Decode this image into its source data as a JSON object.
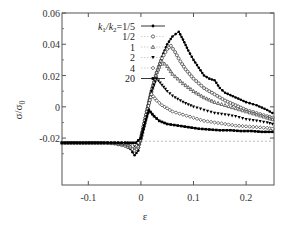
{
  "chart_data": {
    "type": "scatter",
    "title": "",
    "xlabel": "ε",
    "ylabel": "σ/σ0",
    "ylabel_main": "σ/σ",
    "ylabel_sub": "0",
    "xlim": [
      -0.15,
      0.253
    ],
    "ylim": [
      -0.05,
      0.06
    ],
    "xticks": [
      -0.1,
      0,
      0.1,
      0.2
    ],
    "xtick_labels": [
      "-0.1",
      "0",
      "0.1",
      "0.2"
    ],
    "yticks": [
      0.06,
      0.04,
      0.02,
      0,
      -0.02
    ],
    "ytick_labels": [
      "0.06",
      "0.04",
      "0.02",
      "0",
      "-0.02"
    ],
    "grid": false,
    "reference_line": {
      "y": -0.022,
      "style": "dashed",
      "x_from": 0
    },
    "legend": {
      "position": "upper-left",
      "title_prefix": "k1/k2=",
      "entries": [
        "1/5",
        "1/2",
        "1",
        "2",
        "4",
        "20"
      ]
    },
    "series": [
      {
        "name": "k1/k2=1/5",
        "label": "k1/k2=1/5",
        "marker": "filled-circle",
        "line": "solid",
        "x": [
          -0.15,
          -0.13,
          -0.11,
          -0.09,
          -0.07,
          -0.05,
          -0.04,
          -0.03,
          -0.02,
          -0.012,
          -0.005,
          0.0,
          0.01,
          0.02,
          0.03,
          0.04,
          0.05,
          0.06,
          0.072,
          0.08,
          0.09,
          0.1,
          0.11,
          0.12,
          0.13,
          0.14,
          0.15,
          0.16,
          0.18,
          0.2,
          0.22,
          0.24,
          0.25
        ],
        "y": [
          -0.023,
          -0.023,
          -0.023,
          -0.023,
          -0.023,
          -0.0235,
          -0.024,
          -0.025,
          -0.027,
          -0.031,
          -0.028,
          -0.02,
          -0.005,
          0.01,
          0.022,
          0.032,
          0.04,
          0.045,
          0.048,
          0.043,
          0.036,
          0.03,
          0.025,
          0.02,
          0.018,
          0.017,
          0.012,
          0.009,
          0.006,
          0.003,
          0.001,
          -0.002,
          -0.004
        ]
      },
      {
        "name": "1/2",
        "label": "1/2",
        "marker": "open-circle",
        "line": "dotted",
        "x": [
          -0.15,
          -0.11,
          -0.07,
          -0.05,
          -0.03,
          -0.02,
          -0.012,
          -0.005,
          0.0,
          0.01,
          0.02,
          0.03,
          0.04,
          0.05,
          0.057,
          0.065,
          0.075,
          0.085,
          0.1,
          0.12,
          0.14,
          0.16,
          0.18,
          0.2,
          0.22,
          0.24,
          0.25
        ],
        "y": [
          -0.023,
          -0.023,
          -0.023,
          -0.0235,
          -0.025,
          -0.026,
          -0.028,
          -0.026,
          -0.02,
          -0.005,
          0.01,
          0.022,
          0.031,
          0.037,
          0.039,
          0.035,
          0.029,
          0.024,
          0.018,
          0.012,
          0.008,
          0.004,
          0.001,
          -0.002,
          -0.004,
          -0.006,
          -0.007
        ]
      },
      {
        "name": "1",
        "label": "1",
        "marker": "open-triangle",
        "line": "dotted",
        "x": [
          -0.15,
          -0.11,
          -0.07,
          -0.05,
          -0.03,
          -0.02,
          -0.012,
          -0.005,
          0.0,
          0.01,
          0.02,
          0.03,
          0.04,
          0.05,
          0.06,
          0.08,
          0.1,
          0.12,
          0.14,
          0.16,
          0.18,
          0.2,
          0.22,
          0.24,
          0.25
        ],
        "y": [
          -0.023,
          -0.023,
          -0.023,
          -0.0233,
          -0.024,
          -0.025,
          -0.026,
          -0.025,
          -0.02,
          -0.005,
          0.01,
          0.022,
          0.029,
          0.026,
          0.021,
          0.015,
          0.01,
          0.006,
          0.003,
          0.001,
          -0.001,
          -0.003,
          -0.005,
          -0.007,
          -0.008
        ]
      },
      {
        "name": "2",
        "label": "2",
        "marker": "filled-triangle-down",
        "line": "dotted",
        "x": [
          -0.15,
          -0.11,
          -0.07,
          -0.05,
          -0.03,
          -0.02,
          -0.012,
          -0.005,
          0.0,
          0.01,
          0.02,
          0.03,
          0.04,
          0.05,
          0.06,
          0.08,
          0.1,
          0.12,
          0.14,
          0.16,
          0.18,
          0.2,
          0.22,
          0.24,
          0.25
        ],
        "y": [
          -0.023,
          -0.023,
          -0.023,
          -0.023,
          -0.0235,
          -0.024,
          -0.025,
          -0.024,
          -0.02,
          -0.005,
          0.01,
          0.018,
          0.014,
          0.01,
          0.007,
          0.003,
          0.0,
          -0.002,
          -0.004,
          -0.005,
          -0.006,
          -0.008,
          -0.009,
          -0.01,
          -0.011
        ]
      },
      {
        "name": "4",
        "label": "4",
        "marker": "open-diamond",
        "line": "dotted",
        "x": [
          -0.15,
          -0.11,
          -0.07,
          -0.05,
          -0.03,
          -0.02,
          -0.012,
          -0.005,
          0.0,
          0.01,
          0.02,
          0.03,
          0.04,
          0.06,
          0.08,
          0.1,
          0.12,
          0.14,
          0.16,
          0.18,
          0.2,
          0.22,
          0.24,
          0.25
        ],
        "y": [
          -0.023,
          -0.023,
          -0.023,
          -0.023,
          -0.023,
          -0.0235,
          -0.024,
          -0.023,
          -0.02,
          -0.005,
          0.008,
          0.004,
          0.001,
          -0.003,
          -0.005,
          -0.007,
          -0.009,
          -0.01,
          -0.011,
          -0.012,
          -0.0125,
          -0.013,
          -0.0135,
          -0.014
        ]
      },
      {
        "name": "20",
        "label": "20",
        "marker": "filled-square",
        "line": "solid",
        "x": [
          -0.15,
          -0.11,
          -0.07,
          -0.05,
          -0.03,
          -0.02,
          -0.01,
          0.0,
          0.008,
          0.015,
          0.025,
          0.035,
          0.05,
          0.07,
          0.09,
          0.11,
          0.13,
          0.15,
          0.17,
          0.19,
          0.21,
          0.23,
          0.25
        ],
        "y": [
          -0.023,
          -0.023,
          -0.023,
          -0.023,
          -0.023,
          -0.023,
          -0.023,
          -0.02,
          -0.01,
          -0.002,
          -0.006,
          -0.009,
          -0.011,
          -0.012,
          -0.013,
          -0.014,
          -0.0145,
          -0.015,
          -0.015,
          -0.0155,
          -0.0155,
          -0.016,
          -0.016
        ]
      }
    ]
  }
}
